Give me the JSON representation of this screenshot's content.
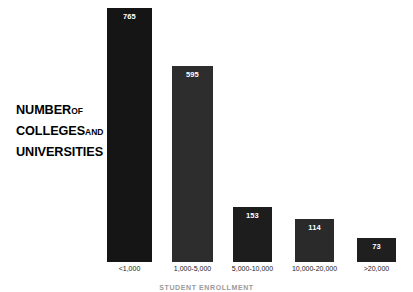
{
  "title": {
    "line1_main": "NUMBER",
    "line1_small": "OF",
    "line2_main": "COLLEGES",
    "line2_small": "AND",
    "line3_main": "UNIVERSITIES"
  },
  "bottom_caption": "STUDENT ENROLLMENT",
  "colors": {
    "background": "#ffffff",
    "bar_primary": "#151515",
    "bar_secondary": "#2d2d2d",
    "value_label": "#ffffff",
    "tick_label": "#1a1a1a"
  },
  "chart_data": {
    "type": "bar",
    "xlabel": "STUDENT ENROLLMENT",
    "ylabel": "",
    "categories": [
      "<1,000",
      "1,000-5,000",
      "5,000-10,000",
      "10,000-20,000",
      ">20,000"
    ],
    "values": [
      765,
      595,
      153,
      114,
      73
    ],
    "value_labels": [
      "765",
      "595",
      "153",
      "114",
      "73"
    ],
    "ylim": [
      0,
      800
    ],
    "grid": false,
    "legend": false,
    "bar_colors": [
      "#151515",
      "#2d2d2d",
      "#222222",
      "#2a2a2a",
      "#222222"
    ],
    "bars": [
      {
        "label": "<1,000",
        "value": 765,
        "value_label": "765",
        "left": 107,
        "width": 45,
        "height": 254,
        "color": "#151515"
      },
      {
        "label": "1,000-5,000",
        "value": 595,
        "value_label": "595",
        "left": 172,
        "width": 41,
        "height": 196,
        "color": "#2d2d2d"
      },
      {
        "label": "5,000-10,000",
        "value": 153,
        "value_label": "153",
        "left": 233,
        "width": 39,
        "height": 55,
        "color": "#1d1d1d"
      },
      {
        "label": "10,000-20,000",
        "value": 114,
        "value_label": "114",
        "left": 295,
        "width": 39,
        "height": 43,
        "color": "#2a2a2a"
      },
      {
        "label": ">20,000",
        "value": 73,
        "value_label": "73",
        "left": 357,
        "width": 39,
        "height": 24,
        "color": "#1f1f1f"
      }
    ]
  }
}
